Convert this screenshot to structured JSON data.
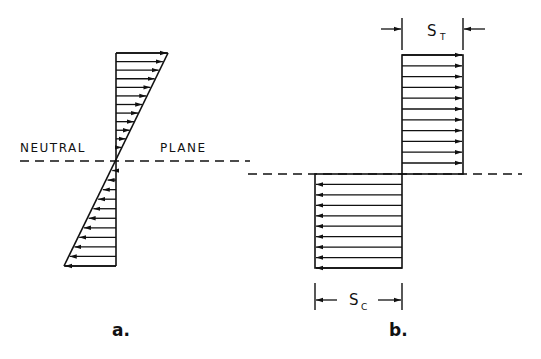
{
  "figure_a": {
    "caption": "a.",
    "neutral_label_left": "NEUTRAL",
    "neutral_label_right": "PLANE",
    "description": "Linear (triangular) stress distribution about the neutral plane",
    "upper_arrow_count": 12,
    "upper_arrow_direction": "right",
    "lower_arrow_count": 11,
    "lower_arrow_direction": "left"
  },
  "figure_b": {
    "caption": "b.",
    "tension_label": "S",
    "tension_subscript": "T",
    "compression_label": "S",
    "compression_subscript": "C",
    "description": "Rectangular (uniform) stress blocks: tension above, compression below neutral plane",
    "tension_arrow_count": 11,
    "tension_arrow_direction": "right",
    "compression_arrow_count": 9,
    "compression_arrow_direction": "left"
  },
  "colors": {
    "ink": "#111111",
    "background": "#ffffff"
  }
}
